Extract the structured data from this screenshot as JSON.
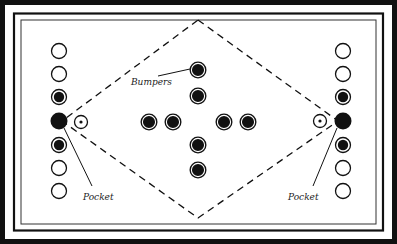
{
  "diagram": {
    "type": "game-board",
    "colors": {
      "ink": "#111111",
      "paper": "#ffffff"
    },
    "labels": {
      "bumpers": "Bumpers",
      "pocket_left": "Pocket",
      "pocket_right": "Pocket"
    },
    "left_column": [
      "empty",
      "empty",
      "filled-ring",
      "pocket",
      "filled-ring",
      "empty",
      "empty"
    ],
    "right_column": [
      "empty",
      "empty",
      "filled-ring",
      "pocket",
      "filled-ring",
      "empty",
      "empty"
    ],
    "bumpers": {
      "count": 8,
      "arrangement": "cross"
    },
    "targets": [
      "left-target",
      "right-target"
    ],
    "outline": "dashed-diamond"
  }
}
